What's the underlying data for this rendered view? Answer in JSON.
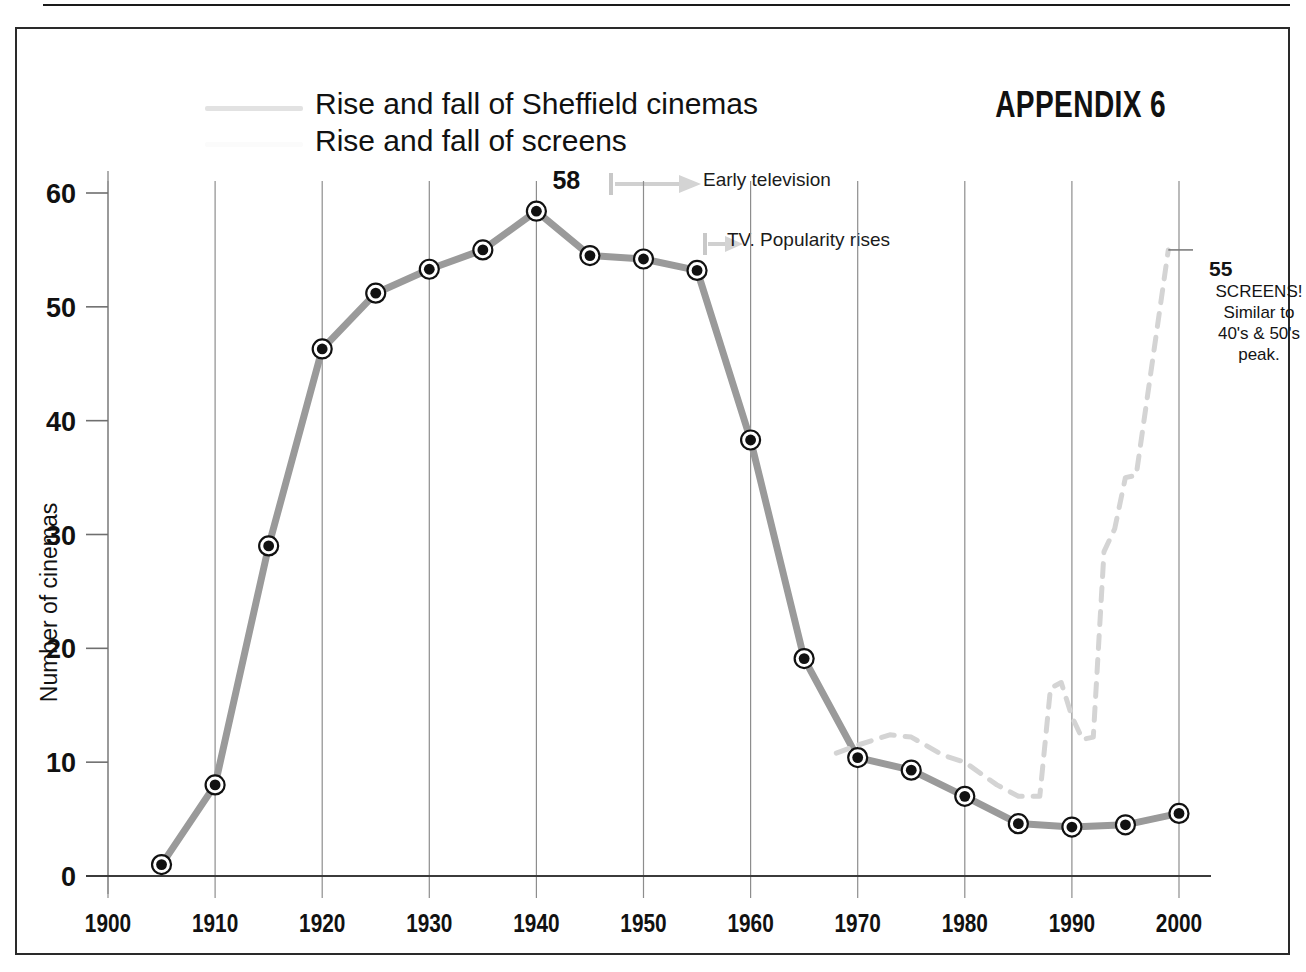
{
  "header": {
    "appendix_label": "APPENDIX 6"
  },
  "legend": {
    "items": [
      {
        "label": "Rise and fall of Sheffield cinemas",
        "color": "#9a9a9a",
        "style": "solid"
      },
      {
        "label": "Rise and fall of screens",
        "color": "#d9d9d9",
        "style": "dashed"
      }
    ]
  },
  "annotations": {
    "early_tv": "Early television",
    "tv_popularity": "TV. Popularity rises",
    "screens_note": {
      "value": "55",
      "line1": "SCREENS!",
      "line2": "Similar to",
      "line3": "40's & 50's",
      "line4": "peak."
    },
    "peak_label": "58"
  },
  "chart_data": {
    "type": "line",
    "title": "Rise and fall of Sheffield cinemas",
    "xlabel": "",
    "ylabel": "Number of cinemas",
    "xlim": [
      1900,
      2000
    ],
    "ylim": [
      0,
      62
    ],
    "xticks": [
      1900,
      1910,
      1920,
      1930,
      1940,
      1950,
      1960,
      1970,
      1980,
      1990,
      2000
    ],
    "yticks": [
      0,
      10,
      20,
      30,
      40,
      50,
      60
    ],
    "grid": "vertical",
    "legend_position": "top-left",
    "series": [
      {
        "name": "Rise and fall of Sheffield cinemas",
        "color": "#9a9a9a",
        "style": "solid",
        "markers": true,
        "x": [
          1905,
          1910,
          1915,
          1920,
          1925,
          1930,
          1935,
          1940,
          1945,
          1950,
          1955,
          1960,
          1965,
          1970,
          1975,
          1980,
          1985,
          1990,
          1995,
          2000
        ],
        "values": [
          1,
          8,
          29,
          46.3,
          51.2,
          53.3,
          55,
          58.4,
          54.5,
          54.2,
          53.2,
          38.3,
          19.1,
          10.4,
          9.3,
          7,
          4.6,
          4.3,
          4.5,
          5.5
        ]
      },
      {
        "name": "Rise and fall of screens",
        "color": "#d4d4d4",
        "style": "dashed",
        "markers": false,
        "x": [
          1968,
          1970,
          1973,
          1975,
          1978,
          1980,
          1983,
          1985,
          1987,
          1988,
          1989,
          1990,
          1991,
          1992,
          1993,
          1994,
          1995,
          1996,
          1999
        ],
        "values": [
          10.8,
          11.5,
          12.4,
          12.2,
          10.6,
          10.0,
          8.0,
          7.0,
          7.0,
          16.5,
          17.0,
          14.0,
          12.0,
          12.2,
          28.5,
          30.5,
          35.0,
          35.2,
          55.0
        ]
      }
    ],
    "point_labels": [
      {
        "x": 1940,
        "y": 58.4,
        "text": "58"
      },
      {
        "x": 1999,
        "y": 55.0,
        "text": "55"
      }
    ]
  }
}
